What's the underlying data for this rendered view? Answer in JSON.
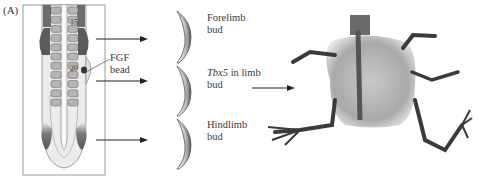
{
  "panel_label": "(A)",
  "embryo": {
    "somite_labels": [
      "15",
      "20"
    ],
    "bead_label_line1": "FGF",
    "bead_label_line2": "bead"
  },
  "buds": [
    {
      "line1": "Forelimb",
      "line2": "bud",
      "italic_prefix": ""
    },
    {
      "line1": " in limb",
      "line2": "bud",
      "italic_prefix": "Tbx5"
    },
    {
      "line1": "Hindlimb",
      "line2": "bud",
      "italic_prefix": ""
    }
  ],
  "colors": {
    "dark_mesoderm": "#5b5b5b",
    "somite": "#b5b5b5",
    "embryo_bg": "#e9e9e9",
    "arrow": "#222222"
  }
}
